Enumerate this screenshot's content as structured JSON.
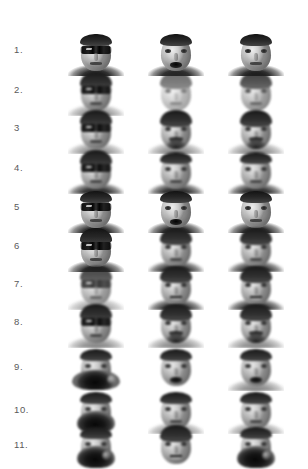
{
  "figure": {
    "type": "face-image-grid",
    "background_color": "#ffffff",
    "label_color": "#5a5a5a",
    "rows": 11,
    "columns": 3,
    "column_names": [
      "occluded-test-image",
      "reconstructed-image",
      "matched-gallery-image"
    ],
    "row_labels": [
      "1.",
      "2.",
      "3",
      "4.",
      "5",
      "6",
      "7.",
      "8.",
      "9.",
      "10.",
      "11."
    ],
    "cells": [
      {
        "row_label": "1.",
        "row_index": 1,
        "occlusion": "sunglasses",
        "faces": [
          {
            "column": 1,
            "name": "occluded-face-1-1",
            "occlusion": "sunglasses",
            "expression": "neutral",
            "hair": "short",
            "blur": "sharp",
            "shoulders": "dark"
          },
          {
            "column": 2,
            "name": "reconstructed-face-1-2",
            "occlusion": "none",
            "expression": "open-mouth",
            "hair": "short",
            "blur": "sharp",
            "shoulders": "dark"
          },
          {
            "column": 3,
            "name": "matched-face-1-3",
            "occlusion": "none",
            "expression": "neutral",
            "hair": "short",
            "blur": "sharp",
            "shoulders": "dark"
          }
        ]
      },
      {
        "row_label": "2.",
        "row_index": 2,
        "occlusion": "sunglasses",
        "faces": [
          {
            "column": 1,
            "name": "occluded-face-2-1",
            "occlusion": "sunglasses",
            "expression": "neutral",
            "hair": "thick",
            "blur": "medium",
            "shoulders": "light"
          },
          {
            "column": 2,
            "name": "reconstructed-face-2-2",
            "occlusion": "none",
            "expression": "neutral",
            "hair": "thick",
            "blur": "heavy",
            "shoulders": "none"
          },
          {
            "column": 3,
            "name": "matched-face-2-3",
            "occlusion": "none",
            "expression": "neutral",
            "hair": "thick",
            "blur": "medium",
            "shoulders": "none"
          }
        ]
      },
      {
        "row_label": "3",
        "row_index": 3,
        "occlusion": "sunglasses",
        "faces": [
          {
            "column": 1,
            "name": "occluded-face-3-1",
            "occlusion": "sunglasses",
            "expression": "neutral",
            "hair": "thick",
            "blur": "medium",
            "shoulders": "light"
          },
          {
            "column": 2,
            "name": "reconstructed-face-3-2",
            "occlusion": "none",
            "expression": "neutral",
            "hair": "thick",
            "facial_hair": "full-beard",
            "blur": "medium",
            "shoulders": "light"
          },
          {
            "column": 3,
            "name": "matched-face-3-3",
            "occlusion": "none",
            "expression": "neutral",
            "hair": "thick",
            "facial_hair": "full-beard",
            "blur": "medium",
            "shoulders": "light"
          }
        ]
      },
      {
        "row_label": "4.",
        "row_index": 4,
        "occlusion": "sunglasses",
        "faces": [
          {
            "column": 1,
            "name": "occluded-face-4-1",
            "occlusion": "sunglasses",
            "expression": "neutral",
            "hair": "thick",
            "blur": "medium",
            "shoulders": "dark"
          },
          {
            "column": 2,
            "name": "reconstructed-face-4-2",
            "occlusion": "none",
            "expression": "neutral",
            "hair": "short",
            "blur": "medium",
            "shoulders": "dark"
          },
          {
            "column": 3,
            "name": "matched-face-4-3",
            "occlusion": "none",
            "expression": "neutral",
            "hair": "short",
            "blur": "medium",
            "shoulders": "dark"
          }
        ]
      },
      {
        "row_label": "5",
        "row_index": 5,
        "occlusion": "sunglasses",
        "faces": [
          {
            "column": 1,
            "name": "occluded-face-5-1",
            "occlusion": "sunglasses",
            "expression": "neutral",
            "hair": "short",
            "blur": "sharp",
            "shoulders": "dark"
          },
          {
            "column": 2,
            "name": "reconstructed-face-5-2",
            "occlusion": "none",
            "expression": "open-mouth",
            "hair": "short",
            "blur": "sharp",
            "shoulders": "dark"
          },
          {
            "column": 3,
            "name": "matched-face-5-3",
            "occlusion": "none",
            "expression": "neutral",
            "hair": "short",
            "blur": "sharp",
            "shoulders": "dark"
          }
        ]
      },
      {
        "row_label": "6",
        "row_index": 6,
        "occlusion": "sunglasses",
        "faces": [
          {
            "column": 1,
            "name": "occluded-face-6-1",
            "occlusion": "sunglasses",
            "expression": "neutral",
            "hair": "thick",
            "blur": "sharp",
            "shoulders": "dark"
          },
          {
            "column": 2,
            "name": "reconstructed-face-6-2",
            "occlusion": "none",
            "expression": "neutral",
            "hair": "thick",
            "blur": "medium",
            "shoulders": "dark"
          },
          {
            "column": 3,
            "name": "matched-face-6-3",
            "occlusion": "none",
            "expression": "neutral",
            "hair": "thick",
            "blur": "medium",
            "shoulders": "dark"
          }
        ]
      },
      {
        "row_label": "7.",
        "row_index": 7,
        "occlusion": "sunglasses",
        "faces": [
          {
            "column": 1,
            "name": "occluded-face-7-1",
            "occlusion": "sunglasses",
            "expression": "neutral",
            "hair": "thick",
            "blur": "medium",
            "shoulders": "light"
          },
          {
            "column": 2,
            "name": "reconstructed-face-7-2",
            "occlusion": "none",
            "expression": "smile",
            "hair": "thick",
            "blur": "medium",
            "shoulders": "dark"
          },
          {
            "column": 3,
            "name": "matched-face-7-3",
            "occlusion": "none",
            "expression": "smile",
            "hair": "thick",
            "blur": "medium",
            "shoulders": "dark"
          }
        ]
      },
      {
        "row_label": "8.",
        "row_index": 8,
        "occlusion": "sunglasses",
        "faces": [
          {
            "column": 1,
            "name": "occluded-face-8-1",
            "occlusion": "sunglasses",
            "expression": "neutral",
            "hair": "thick",
            "blur": "medium",
            "shoulders": "light"
          },
          {
            "column": 2,
            "name": "reconstructed-face-8-2",
            "occlusion": "none",
            "expression": "neutral",
            "hair": "thick",
            "facial_hair": "goatee",
            "blur": "medium",
            "shoulders": "light"
          },
          {
            "column": 3,
            "name": "matched-face-8-3",
            "occlusion": "none",
            "expression": "neutral",
            "hair": "thick",
            "facial_hair": "goatee",
            "blur": "medium",
            "shoulders": "light"
          }
        ]
      },
      {
        "row_label": "9.",
        "row_index": 9,
        "occlusion": "scarf",
        "faces": [
          {
            "column": 1,
            "name": "occluded-face-9-1",
            "occlusion": "scarf",
            "expression": "neutral",
            "hair": "short",
            "blur": "medium",
            "shoulders": "none"
          },
          {
            "column": 2,
            "name": "reconstructed-face-9-2",
            "occlusion": "none",
            "expression": "open-mouth",
            "hair": "short",
            "blur": "medium",
            "shoulders": "none"
          },
          {
            "column": 3,
            "name": "matched-face-9-3",
            "occlusion": "none",
            "expression": "open-mouth",
            "hair": "short",
            "blur": "medium",
            "shoulders": "light"
          }
        ]
      },
      {
        "row_label": "10.",
        "row_index": 10,
        "occlusion": "scarf",
        "faces": [
          {
            "column": 1,
            "name": "occluded-face-10-1",
            "occlusion": "scarf",
            "expression": "neutral",
            "hair": "short",
            "blur": "medium",
            "shoulders": "none"
          },
          {
            "column": 2,
            "name": "reconstructed-face-10-2",
            "occlusion": "none",
            "expression": "neutral",
            "hair": "short",
            "blur": "medium",
            "shoulders": "light"
          },
          {
            "column": 3,
            "name": "matched-face-10-3",
            "occlusion": "none",
            "expression": "neutral",
            "hair": "short",
            "blur": "medium",
            "shoulders": "light"
          }
        ]
      },
      {
        "row_label": "11.",
        "row_index": 11,
        "occlusion": "scarf",
        "faces": [
          {
            "column": 1,
            "name": "occluded-face-11-1",
            "occlusion": "scarf",
            "expression": "neutral",
            "hair": "short",
            "blur": "medium",
            "shoulders": "none"
          },
          {
            "column": 2,
            "name": "reconstructed-face-11-2",
            "occlusion": "none",
            "expression": "smile",
            "hair": "thick",
            "blur": "medium",
            "shoulders": "none"
          },
          {
            "column": 3,
            "name": "matched-face-11-3",
            "occlusion": "scarf",
            "expression": "neutral",
            "hair": "short",
            "blur": "medium",
            "shoulders": "none"
          }
        ]
      }
    ]
  }
}
